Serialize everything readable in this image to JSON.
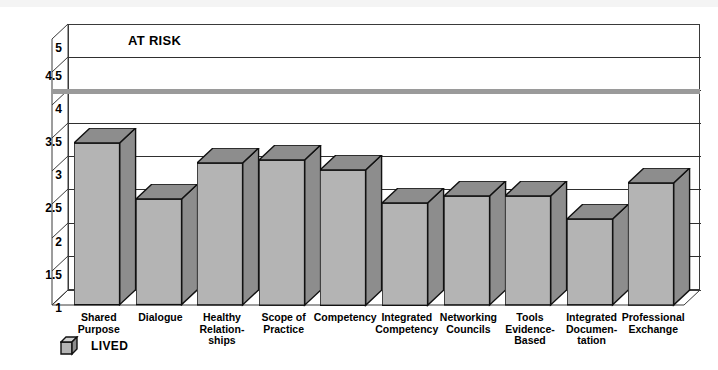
{
  "chart_data": {
    "type": "bar",
    "title": "",
    "annotations": [
      {
        "text": "AT RISK",
        "x_px": 130,
        "y_px": 40
      },
      {
        "text": "at-risk threshold line",
        "value": 4.3
      }
    ],
    "categories": [
      "Shared\nPurpose",
      "Dialogue",
      "Healthy\nRelation-\nships",
      "Scope of\nPractice",
      "Competency",
      "Integrated\nCompetency",
      "Networking\nCouncils",
      "Tools\nEvidence-\nBased",
      "Integrated\nDocumen-\ntation",
      "Professional\nExchange"
    ],
    "series": [
      {
        "name": "LIVED",
        "values": [
          3.45,
          2.6,
          3.15,
          3.2,
          3.05,
          2.55,
          2.65,
          2.65,
          2.3,
          2.85
        ]
      }
    ],
    "xlabel": "",
    "ylabel": "",
    "ylim": [
      1,
      5
    ],
    "yticks": [
      "1",
      "1.5",
      "2",
      "2.5",
      "3",
      "3.5",
      "4",
      "4.5",
      "5"
    ],
    "ytick_values": [
      1,
      1.5,
      2,
      2.5,
      3,
      3.5,
      4,
      4.5,
      5
    ],
    "grid": true,
    "legend_position": "bottom-left",
    "style": "3d-column",
    "colors": {
      "bar_face": "#b4b4b4",
      "bar_shade": "#8d8d8d",
      "bar_outline": "#111111",
      "threshold_line": "#9a9a9a",
      "axis": "#3a3a3a",
      "background": "#ffffff"
    }
  },
  "risk_label": "AT RISK",
  "legend": {
    "icon": "cube-icon",
    "label": "LIVED"
  },
  "yticks": [
    "5",
    "4.5",
    "4",
    "3.5",
    "3",
    "2.5",
    "2",
    "1.5",
    "1"
  ],
  "categories": [
    {
      "l1": "Shared",
      "l2": "Purpose",
      "l3": ""
    },
    {
      "l1": "Dialogue",
      "l2": "",
      "l3": ""
    },
    {
      "l1": "Healthy",
      "l2": "Relation-",
      "l3": "ships"
    },
    {
      "l1": "Scope of",
      "l2": "Practice",
      "l3": ""
    },
    {
      "l1": "Competency",
      "l2": "",
      "l3": ""
    },
    {
      "l1": "Integrated",
      "l2": "Competency",
      "l3": ""
    },
    {
      "l1": "Networking",
      "l2": "Councils",
      "l3": ""
    },
    {
      "l1": "Tools",
      "l2": "Evidence-",
      "l3": "Based"
    },
    {
      "l1": "Integrated",
      "l2": "Documen-",
      "l3": "tation"
    },
    {
      "l1": "Professional",
      "l2": "Exchange",
      "l3": ""
    }
  ]
}
